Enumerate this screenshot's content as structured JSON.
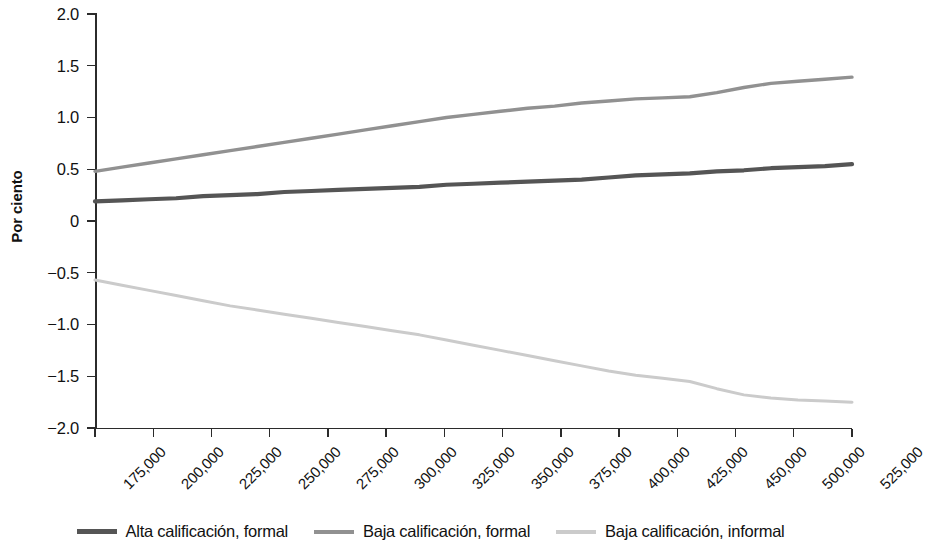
{
  "chart_data": {
    "type": "line",
    "title": "",
    "subtitle": "",
    "xlabel": "",
    "ylabel": "Por ciento",
    "xlim": [
      175000,
      525000
    ],
    "ylim": [
      -2.0,
      2.0
    ],
    "grid": false,
    "legend_position": "bottom",
    "x_tick_labels": [
      "175,000",
      "200,000",
      "225,000",
      "250,000",
      "275,000",
      "300,000",
      "325,000",
      "350,000",
      "375,000",
      "400,000",
      "425,000",
      "450,000",
      "500,000",
      "525,000"
    ],
    "y_tick_labels": [
      "2.0",
      "1.5",
      "1.0",
      "0.5",
      "0",
      "-0.5",
      "-1.0",
      "-1.5",
      "-2.0"
    ],
    "y_tick_values": [
      2.0,
      1.5,
      1.0,
      0.5,
      0,
      -0.5,
      -1.0,
      -1.5,
      -2.0
    ],
    "x": [
      175000,
      187500,
      200000,
      212500,
      225000,
      237500,
      250000,
      262500,
      275000,
      287500,
      300000,
      312500,
      325000,
      337500,
      350000,
      362500,
      375000,
      387500,
      400000,
      412500,
      425000,
      437500,
      450000,
      462500,
      475000,
      487500,
      500000,
      512500,
      525000
    ],
    "series": [
      {
        "name": "Alta calificación, formal",
        "color": "#555555",
        "values": [
          0.19,
          0.2,
          0.21,
          0.22,
          0.24,
          0.25,
          0.26,
          0.28,
          0.29,
          0.3,
          0.31,
          0.32,
          0.33,
          0.35,
          0.36,
          0.37,
          0.38,
          0.39,
          0.4,
          0.42,
          0.44,
          0.45,
          0.46,
          0.48,
          0.49,
          0.51,
          0.52,
          0.53,
          0.55
        ]
      },
      {
        "name": "Baja calificación, formal",
        "color": "#919191",
        "values": [
          0.48,
          0.52,
          0.56,
          0.6,
          0.64,
          0.68,
          0.72,
          0.76,
          0.8,
          0.84,
          0.88,
          0.92,
          0.96,
          1.0,
          1.03,
          1.06,
          1.09,
          1.11,
          1.14,
          1.16,
          1.18,
          1.19,
          1.2,
          1.24,
          1.29,
          1.33,
          1.35,
          1.37,
          1.39
        ]
      },
      {
        "name": "Baja calificación, informal",
        "color": "#cbcbcb",
        "values": [
          -0.57,
          -0.62,
          -0.67,
          -0.72,
          -0.77,
          -0.82,
          -0.86,
          -0.9,
          -0.94,
          -0.98,
          -1.02,
          -1.06,
          -1.1,
          -1.15,
          -1.2,
          -1.25,
          -1.3,
          -1.35,
          -1.4,
          -1.45,
          -1.49,
          -1.52,
          -1.55,
          -1.62,
          -1.68,
          -1.71,
          -1.73,
          -1.74,
          -1.75
        ]
      }
    ]
  },
  "legend": {
    "items": [
      {
        "label": "Alta calificación, formal",
        "color": "#555555"
      },
      {
        "label": "Baja calificación, formal",
        "color": "#919191"
      },
      {
        "label": "Baja calificación, informal",
        "color": "#cbcbcb"
      }
    ]
  }
}
